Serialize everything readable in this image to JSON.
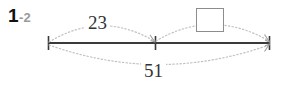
{
  "problem": {
    "number": "1",
    "sub": "-2"
  },
  "diagram": {
    "type": "number-line-bar-model",
    "line_color": "#3a3a3a",
    "arc_color": "#c2c2c2",
    "box_border_color": "#8d8d8d",
    "text_color": "#333333",
    "label_color": "#9a9a9a",
    "ticks": [
      {
        "name": "left-endpoint",
        "x": 48
      },
      {
        "name": "middle-point",
        "x": 155
      },
      {
        "name": "right-endpoint",
        "x": 270
      }
    ],
    "segments": [
      {
        "name": "top-left-arc",
        "label": "23",
        "from": "left-endpoint",
        "to": "middle-point",
        "position": "above",
        "arrow": "right"
      },
      {
        "name": "top-right-arc",
        "label": "",
        "from": "middle-point",
        "to": "right-endpoint",
        "position": "above",
        "arrow": "right",
        "label_is_answer_box": true
      },
      {
        "name": "bottom-arc",
        "label": "51",
        "from": "left-endpoint",
        "to": "right-endpoint",
        "position": "below",
        "arrow": "right"
      }
    ]
  },
  "labels": {
    "top_left_value": "23",
    "top_right_value": "",
    "bottom_value": "51"
  }
}
